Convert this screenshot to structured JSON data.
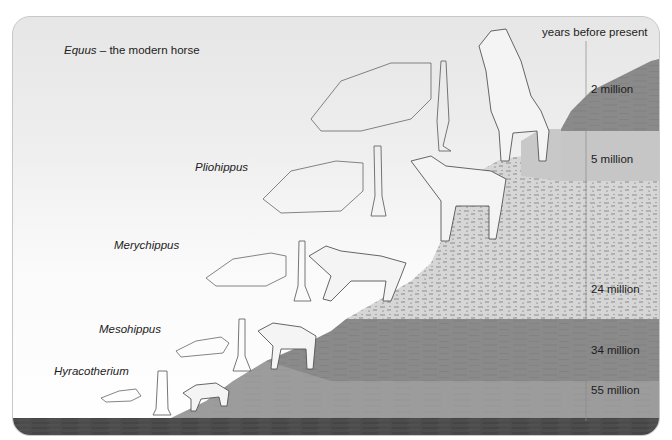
{
  "diagram": {
    "axis_title": "years before present",
    "species": [
      {
        "name": "Equus",
        "suffix": " – the modern horse"
      },
      {
        "name": "Pliohippus",
        "suffix": ""
      },
      {
        "name": "Merychippus",
        "suffix": ""
      },
      {
        "name": "Mesohippus",
        "suffix": ""
      },
      {
        "name": "Hyracotherium",
        "suffix": ""
      }
    ],
    "time_markers": [
      {
        "label": "2 million"
      },
      {
        "label": "5 million"
      },
      {
        "label": "24 million"
      },
      {
        "label": "34 million"
      },
      {
        "label": "55 million"
      }
    ],
    "colors": {
      "stratum_2m": "#8c8c8c",
      "stratum_5m": "#c8c8c8",
      "stratum_24m": "#d4d4d4",
      "stratum_34m": "#8a8a8a",
      "stratum_55m": "#9a9a9a",
      "bedrock": "#4a4a4a",
      "line_art": "#555555"
    }
  }
}
